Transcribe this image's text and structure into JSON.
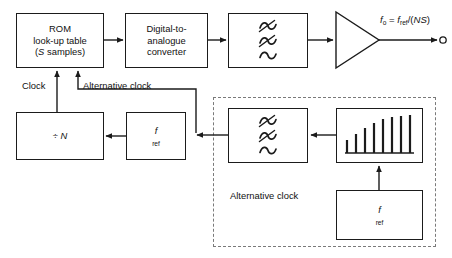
{
  "diagram": {
    "type": "block-diagram",
    "colors": {
      "stroke": "#1b1b1b",
      "dashed": "#7a7a7a",
      "background": "#ffffff",
      "text": "#111111"
    },
    "blocks": [
      {
        "id": "rom",
        "lines": [
          "ROM",
          "look-up table",
          "(S samples)"
        ],
        "italic_tokens": [
          "S"
        ]
      },
      {
        "id": "dac",
        "lines": [
          "Digital-to-",
          "analogue",
          "converter"
        ]
      },
      {
        "id": "filter_top",
        "lines": [],
        "icon": "lowpass-filter-icon"
      },
      {
        "id": "amplifier",
        "lines": [],
        "icon": "amplifier-triangle-icon"
      },
      {
        "id": "divider",
        "lines": [
          "÷ N"
        ],
        "italic_tokens": [
          "N"
        ]
      },
      {
        "id": "fref_main",
        "lines": [
          "f_ref"
        ],
        "base": "f",
        "subscript": "ref"
      },
      {
        "id": "filter_alt",
        "lines": [],
        "icon": "lowpass-filter-icon"
      },
      {
        "id": "comb",
        "lines": [],
        "icon": "comb-spectrum-icon"
      },
      {
        "id": "fref_alt",
        "lines": [
          "f_ref"
        ],
        "base": "f",
        "subscript": "ref"
      }
    ],
    "labels": {
      "clock": "Clock",
      "alternative_clock_wire": "Alternative clock",
      "alternative_clock_box_line1": "Alternative",
      "alternative_clock_box_line2": "clock"
    },
    "output": {
      "formula_base": "f",
      "formula_sub": "o",
      "formula_eq": " = ",
      "formula_num_base": "f",
      "formula_num_sub": "ref",
      "formula_tail": "/(NS)",
      "formula_plain": "fo = fref/(NS)",
      "terminal": "open-circle"
    },
    "comb_spectrum": {
      "count": 8,
      "heights_pct": [
        32,
        46,
        62,
        74,
        86,
        92,
        96,
        100
      ]
    }
  }
}
